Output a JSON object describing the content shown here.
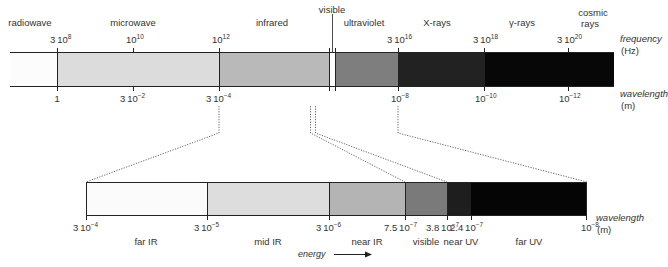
{
  "top_spectrum": {
    "bands": [
      {
        "name": "radiowave",
        "label": "radiowave",
        "x0": 10,
        "x1": 57,
        "color": "#fcfcfc"
      },
      {
        "name": "microwave",
        "label": "microwave",
        "x0": 57,
        "x1": 219,
        "color": "#dcdcdc"
      },
      {
        "name": "infrared",
        "label": "infrared",
        "x0": 219,
        "x1": 329,
        "color": "#b9b9b9"
      },
      {
        "name": "visible",
        "label": "visible",
        "x0": 329,
        "x1": 335,
        "color": "#ffffff"
      },
      {
        "name": "ultraviolet",
        "label": "ultraviolet",
        "x0": 335,
        "x1": 398,
        "color": "#7e7e7e"
      },
      {
        "name": "x-rays",
        "label": "X-rays",
        "x0": 398,
        "x1": 484,
        "color": "#222222"
      },
      {
        "name": "gamma-rays",
        "label": "γ-rays",
        "x0": 484,
        "x1": 614,
        "color": "#070707"
      }
    ],
    "band_labels": [
      {
        "text": "radiowave",
        "x": 30,
        "y": 17
      },
      {
        "text": "microwave",
        "x": 133,
        "y": 17
      },
      {
        "text": "infrared",
        "x": 272,
        "y": 17
      },
      {
        "text": "visible",
        "x": 332,
        "y": 4
      },
      {
        "text": "ultraviolet",
        "x": 364,
        "y": 17
      },
      {
        "text": "X-rays",
        "x": 437,
        "y": 17
      },
      {
        "text": "γ-rays",
        "x": 522,
        "y": 17
      },
      {
        "text": "cosmic",
        "x": 593,
        "y": 7
      },
      {
        "text": "rays",
        "x": 590,
        "y": 18
      }
    ],
    "frequency_ticks": [
      {
        "x": 57,
        "coef": "3",
        "base": "10",
        "exp": "8"
      },
      {
        "x": 133,
        "coef": "",
        "base": "10",
        "exp": "10"
      },
      {
        "x": 219,
        "coef": "",
        "base": "10",
        "exp": "12"
      },
      {
        "x": 398,
        "coef": "3",
        "base": "10",
        "exp": "16"
      },
      {
        "x": 484,
        "coef": "3",
        "base": "10",
        "exp": "18"
      },
      {
        "x": 568,
        "coef": "3",
        "base": "10",
        "exp": "20"
      }
    ],
    "wavelength_ticks": [
      {
        "x": 57,
        "coef": "1",
        "base": "",
        "exp": ""
      },
      {
        "x": 133,
        "coef": "3",
        "base": "10",
        "exp": "−2"
      },
      {
        "x": 219,
        "coef": "3",
        "base": "10",
        "exp": "−4"
      },
      {
        "x": 398,
        "coef": "",
        "base": "10",
        "exp": "−8"
      },
      {
        "x": 484,
        "coef": "",
        "base": "10",
        "exp": "−10"
      },
      {
        "x": 568,
        "coef": "",
        "base": "10",
        "exp": "−12"
      }
    ],
    "frequency_axis_label": "frequency",
    "frequency_unit": "(Hz)",
    "wavelength_axis_label": "wavelength",
    "wavelength_unit": "(m)"
  },
  "bottom_spectrum": {
    "bands": [
      {
        "name": "far-ir",
        "label": "far IR",
        "x0": 86,
        "x1": 207,
        "color": "#fbfbfb"
      },
      {
        "name": "mid-ir",
        "label": "mid IR",
        "x0": 207,
        "x1": 329,
        "color": "#dddddd"
      },
      {
        "name": "near-ir",
        "label": "near IR",
        "x0": 329,
        "x1": 405,
        "color": "#b4b4b4"
      },
      {
        "name": "visible",
        "label": "visible",
        "x0": 405,
        "x1": 447,
        "color": "#7a7a7a"
      },
      {
        "name": "near-uv",
        "label": "near UV",
        "x0": 447,
        "x1": 471,
        "color": "#1e1e1e"
      },
      {
        "name": "far-uv",
        "label": "far UV",
        "x0": 471,
        "x1": 587,
        "color": "#050505"
      }
    ],
    "band_labels": [
      {
        "text": "far IR",
        "x": 146
      },
      {
        "text": "mid IR",
        "x": 268
      },
      {
        "text": "near IR",
        "x": 367
      },
      {
        "text": "visible",
        "x": 426
      },
      {
        "text": "near UV",
        "x": 461
      },
      {
        "text": "far UV",
        "x": 529
      }
    ],
    "wavelength_ticks": [
      {
        "x": 86,
        "coef": "3",
        "base": "10",
        "exp": "−4"
      },
      {
        "x": 207,
        "coef": "3",
        "base": "10",
        "exp": "−5"
      },
      {
        "x": 329,
        "coef": "3",
        "base": "10",
        "exp": "−6"
      },
      {
        "x": 405,
        "coef": "7.5",
        "base": "10",
        "exp": "−7"
      },
      {
        "x": 447,
        "coef": "3.8",
        "base": "10",
        "exp": "−7"
      },
      {
        "x": 471,
        "coef": "2.4",
        "base": "10",
        "exp": "−7"
      },
      {
        "x": 587,
        "coef": "",
        "base": "10",
        "exp": "−8"
      }
    ],
    "wavelength_axis_label": "wavelength",
    "wavelength_unit": "(m)"
  },
  "energy": {
    "label": "energy",
    "arrow_direction": "right"
  },
  "colors": {
    "line": "#222222",
    "dotted": "#555555",
    "text": "#333333"
  }
}
